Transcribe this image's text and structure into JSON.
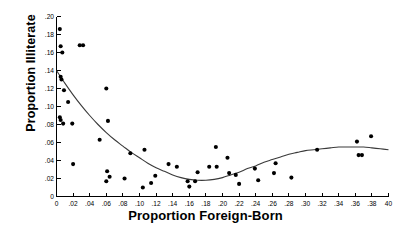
{
  "chart_data": {
    "type": "scatter",
    "title": "",
    "xlabel": "Proportion Foreign-Born",
    "ylabel": "Proportion Illiterate",
    "xlim": [
      0,
      0.4
    ],
    "ylim": [
      0,
      0.2
    ],
    "xticks": [
      0,
      0.02,
      0.04,
      0.06,
      0.08,
      0.1,
      0.12,
      0.14,
      0.16,
      0.18,
      0.2,
      0.22,
      0.24,
      0.26,
      0.28,
      0.3,
      0.32,
      0.34,
      0.36,
      0.38,
      0.4
    ],
    "xtick_labels": [
      "0",
      ".02",
      ".04",
      ".06",
      ".08",
      ".10",
      ".12",
      ".14",
      ".16",
      ".18",
      ".20",
      ".22",
      ".24",
      ".26",
      ".28",
      ".30",
      ".32",
      ".34",
      ".36",
      ".38",
      "40"
    ],
    "yticks": [
      0,
      0.02,
      0.04,
      0.06,
      0.08,
      0.1,
      0.12,
      0.14,
      0.16,
      0.18,
      0.2
    ],
    "ytick_labels": [
      "0",
      ".02",
      ".04",
      ".06",
      ".08",
      ".10",
      ".12",
      ".14",
      ".16",
      ".18",
      ".20"
    ],
    "grid": false,
    "legend": null,
    "marker": "filled-circle",
    "marker_color": "#000000",
    "curve_color": "#3a3a3a",
    "points": [
      [
        0.004,
        0.186
      ],
      [
        0.005,
        0.167
      ],
      [
        0.007,
        0.16
      ],
      [
        0.028,
        0.168
      ],
      [
        0.032,
        0.168
      ],
      [
        0.06,
        0.12
      ],
      [
        0.005,
        0.133
      ],
      [
        0.006,
        0.13
      ],
      [
        0.009,
        0.118
      ],
      [
        0.014,
        0.105
      ],
      [
        0.004,
        0.088
      ],
      [
        0.005,
        0.085
      ],
      [
        0.008,
        0.081
      ],
      [
        0.019,
        0.081
      ],
      [
        0.062,
        0.084
      ],
      [
        0.052,
        0.063
      ],
      [
        0.089,
        0.048
      ],
      [
        0.106,
        0.052
      ],
      [
        0.02,
        0.036
      ],
      [
        0.06,
        0.017
      ],
      [
        0.061,
        0.028
      ],
      [
        0.064,
        0.022
      ],
      [
        0.082,
        0.02
      ],
      [
        0.104,
        0.01
      ],
      [
        0.114,
        0.015
      ],
      [
        0.119,
        0.023
      ],
      [
        0.135,
        0.036
      ],
      [
        0.145,
        0.033
      ],
      [
        0.158,
        0.017
      ],
      [
        0.16,
        0.011
      ],
      [
        0.167,
        0.017
      ],
      [
        0.17,
        0.027
      ],
      [
        0.184,
        0.033
      ],
      [
        0.192,
        0.055
      ],
      [
        0.193,
        0.033
      ],
      [
        0.206,
        0.043
      ],
      [
        0.208,
        0.026
      ],
      [
        0.216,
        0.024
      ],
      [
        0.22,
        0.014
      ],
      [
        0.239,
        0.031
      ],
      [
        0.243,
        0.018
      ],
      [
        0.262,
        0.026
      ],
      [
        0.264,
        0.037
      ],
      [
        0.283,
        0.021
      ],
      [
        0.314,
        0.052
      ],
      [
        0.362,
        0.061
      ],
      [
        0.364,
        0.046
      ],
      [
        0.368,
        0.046
      ],
      [
        0.379,
        0.067
      ]
    ],
    "fit_curve": {
      "description": "smoothed cubic fit",
      "points": [
        [
          0.0,
          0.14
        ],
        [
          0.01,
          0.126
        ],
        [
          0.02,
          0.113
        ],
        [
          0.03,
          0.101
        ],
        [
          0.04,
          0.09
        ],
        [
          0.05,
          0.08
        ],
        [
          0.06,
          0.071
        ],
        [
          0.07,
          0.063
        ],
        [
          0.08,
          0.056
        ],
        [
          0.09,
          0.049
        ],
        [
          0.1,
          0.043
        ],
        [
          0.11,
          0.037
        ],
        [
          0.12,
          0.032
        ],
        [
          0.13,
          0.028
        ],
        [
          0.14,
          0.024
        ],
        [
          0.15,
          0.021
        ],
        [
          0.16,
          0.019
        ],
        [
          0.17,
          0.018
        ],
        [
          0.18,
          0.018
        ],
        [
          0.19,
          0.019
        ],
        [
          0.2,
          0.021
        ],
        [
          0.21,
          0.024
        ],
        [
          0.22,
          0.027
        ],
        [
          0.23,
          0.031
        ],
        [
          0.24,
          0.034
        ],
        [
          0.25,
          0.038
        ],
        [
          0.26,
          0.041
        ],
        [
          0.27,
          0.044
        ],
        [
          0.28,
          0.047
        ],
        [
          0.29,
          0.049
        ],
        [
          0.3,
          0.051
        ],
        [
          0.31,
          0.052
        ],
        [
          0.32,
          0.053
        ],
        [
          0.33,
          0.054
        ],
        [
          0.34,
          0.055
        ],
        [
          0.35,
          0.055
        ],
        [
          0.36,
          0.055
        ],
        [
          0.37,
          0.055
        ],
        [
          0.38,
          0.054
        ],
        [
          0.39,
          0.053
        ],
        [
          0.4,
          0.052
        ]
      ]
    }
  }
}
